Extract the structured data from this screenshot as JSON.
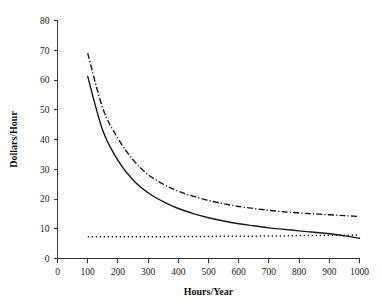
{
  "chart_data": {
    "type": "line",
    "title": "",
    "subtitle": "",
    "xlabel": "Hours/Year",
    "ylabel": "Dollars/Hour",
    "xlim": [
      0,
      1000
    ],
    "ylim": [
      0,
      80
    ],
    "xticks": [
      0,
      100,
      200,
      300,
      400,
      500,
      600,
      700,
      800,
      900,
      1000
    ],
    "yticks": [
      0,
      10,
      20,
      30,
      40,
      50,
      60,
      70,
      80
    ],
    "xtick_labels": [
      "0",
      "100",
      "200",
      "300",
      "400",
      "500",
      "600",
      "700",
      "800",
      "900",
      "1000"
    ],
    "ytick_labels": [
      "0",
      "10",
      "20",
      "30",
      "40",
      "50",
      "60",
      "70",
      "80"
    ],
    "grid": false,
    "legend": false,
    "legend_position": "none",
    "annotations": [],
    "x": [
      100,
      150,
      200,
      250,
      300,
      350,
      400,
      450,
      500,
      550,
      600,
      650,
      700,
      750,
      800,
      850,
      900,
      950,
      1000
    ],
    "series": [
      {
        "name": "upper-cost-curve",
        "style": "dash-dot",
        "color": "#181818",
        "values": [
          69.0,
          50.5,
          40.4,
          33.2,
          28.2,
          25.0,
          22.6,
          20.9,
          19.5,
          18.4,
          17.5,
          16.8,
          16.2,
          15.7,
          15.3,
          15.0,
          14.7,
          14.4,
          14.1
        ]
      },
      {
        "name": "lower-cost-curve",
        "style": "solid",
        "color": "#181818",
        "values": [
          61.2,
          43.0,
          33.0,
          26.4,
          22.1,
          19.1,
          16.8,
          15.1,
          13.7,
          12.6,
          11.7,
          11.0,
          10.3,
          9.8,
          9.3,
          8.8,
          8.3,
          7.6,
          6.8
        ]
      },
      {
        "name": "constant-reference-line",
        "style": "dotted",
        "color": "#181818",
        "values": [
          7.3,
          7.3,
          7.3,
          7.3,
          7.3,
          7.3,
          7.4,
          7.4,
          7.4,
          7.5,
          7.5,
          7.5,
          7.6,
          7.6,
          7.7,
          7.7,
          7.8,
          7.8,
          7.9
        ]
      }
    ]
  }
}
